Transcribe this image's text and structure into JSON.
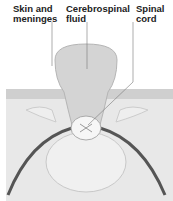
{
  "diagram": {
    "labels": [
      {
        "id": "skin",
        "text": "Skin and\nmeninges"
      },
      {
        "id": "csf",
        "text": "Cerebrospinal\nfluid"
      },
      {
        "id": "cord",
        "text": "Spinal\ncord"
      }
    ],
    "colors": {
      "skin": "#e6e6e6",
      "sac": "#d2d2d2",
      "nerve": "#555555",
      "bone": "#efefef",
      "line": "#777777"
    }
  }
}
